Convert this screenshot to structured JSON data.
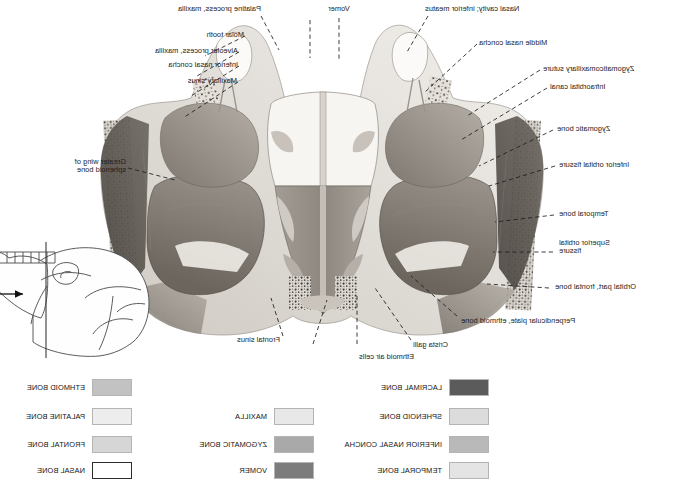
{
  "figure": {
    "specimen_description": "Grayscale photograph of a coronal (frontal) section through the human skull showing the orbits, nasal cavity, maxillary sinuses and ethmoid air cells",
    "orientation_note": "Image is horizontally mirrored"
  },
  "labels": [
    {
      "id": "nasal-cavity-inferior-meatus",
      "text": "Nasal cavity; inferior meatus",
      "align": "right"
    },
    {
      "id": "vomer",
      "text": "Vomer",
      "align": "center"
    },
    {
      "id": "palatine-process-maxilla",
      "text": "Palatine process, maxilla",
      "align": "left"
    },
    {
      "id": "molar-tooth",
      "text": "Molar tooth",
      "align": "left"
    },
    {
      "id": "alveolar-process-maxilla",
      "text": "Alveolar process, maxilla",
      "align": "left"
    },
    {
      "id": "inferior-nasal-concha",
      "text": "Inferior nasal concha",
      "align": "left"
    },
    {
      "id": "maxillary-sinus",
      "text": "Maxillary sinus",
      "align": "left"
    },
    {
      "id": "greater-wing-sphenoid-bone",
      "text": "Greater wing of\nsphenoid bone",
      "align": "left"
    },
    {
      "id": "middle-nasal-concha",
      "text": "Middle nasal concha",
      "align": "right"
    },
    {
      "id": "zygomaticomaxillary-suture",
      "text": "Zygomaticomaxillary suture",
      "align": "right"
    },
    {
      "id": "infraorbital-canal",
      "text": "Infraorbital canal",
      "align": "right"
    },
    {
      "id": "zygomatic-bone",
      "text": "Zygomatic bone",
      "align": "right"
    },
    {
      "id": "inferior-orbital-fissure",
      "text": "Inferior orbital fissure",
      "align": "right"
    },
    {
      "id": "temporal-bone",
      "text": "Temporal bone",
      "align": "right"
    },
    {
      "id": "superior-orbital-fissure",
      "text": "Superior orbital\nfissure",
      "align": "right"
    },
    {
      "id": "orbital-part-frontal-bone",
      "text": "Orbital part, frontal bone",
      "align": "right"
    },
    {
      "id": "perpendicular-plate-ethmoid-bone",
      "text": "Perpendicular plate, ethmoid bone",
      "align": "right"
    },
    {
      "id": "crista-galli",
      "text": "Crista galli",
      "align": "right"
    },
    {
      "id": "ethmoid-air-cells",
      "text": "Ethmoid air cells",
      "align": "right"
    },
    {
      "id": "frontal-sinus",
      "text": "Frontal sinus",
      "align": "right"
    }
  ],
  "legend": {
    "columns": [
      {
        "id": "legend-column-left",
        "items": [
          {
            "id": "lacrimal-bone",
            "label": "LACRIMAL BONE",
            "color": "#5b5b5b",
            "outline": false
          },
          {
            "id": "sphenoid-bone",
            "label": "SPHENOID BONE",
            "color": "#dcdcdc",
            "outline": false
          },
          {
            "id": "inferior-nasal-concha",
            "label": "INFERIOR NASAL CONCHA",
            "color": "#b9b9b9",
            "outline": false
          },
          {
            "id": "temporal-bone",
            "label": "TEMPORAL BONE",
            "color": "#e4e4e4",
            "outline": false
          }
        ]
      },
      {
        "id": "legend-column-middle",
        "items": [
          {
            "id": "maxilla",
            "label": "MAXILLA",
            "color": "#e8e8e8",
            "outline": false
          },
          {
            "id": "zygomatic-bone",
            "label": "ZYGOMATIC BONE",
            "color": "#a9a9a9",
            "outline": false
          },
          {
            "id": "vomer",
            "label": "VOMER",
            "color": "#7c7c7c",
            "outline": false
          }
        ]
      },
      {
        "id": "legend-column-right",
        "items": [
          {
            "id": "ethmoid-bone",
            "label": "ETHMOID BONE",
            "color": "#c2c2c2",
            "outline": false
          },
          {
            "id": "palatine-bone",
            "label": "PALATINE BONE",
            "color": "#ededed",
            "outline": false
          },
          {
            "id": "frontal-bone",
            "label": "FRONTAL BONE",
            "color": "#d6d6d6",
            "outline": false
          },
          {
            "id": "nasal-bone",
            "label": "NASAL BONE",
            "color": "#ffffff",
            "outline": true
          }
        ]
      }
    ]
  },
  "inset": {
    "id": "skull-orientation-inset",
    "description": "Lateral outline of the skull with a vertical line marking the plane of section and an arrow showing the direction of view",
    "section_plane_label": "plane of section",
    "view_arrow_label": "direction of view"
  },
  "colors": {
    "label_text": "#1c1c1c",
    "leader_line": "#1d1d1d",
    "background": "#ffffff",
    "inset_stroke": "#4a4a4a"
  }
}
